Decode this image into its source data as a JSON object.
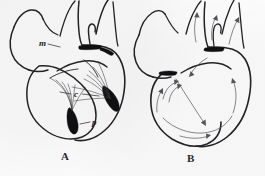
{
  "plate": {
    "kind": "anatomical-engraving",
    "subject": "heart",
    "background_color": "#fbfbfc",
    "ink_color": "#232326",
    "fill_color": "#101012",
    "arrow_color": "#55555c",
    "panels": [
      {
        "caption": "A",
        "caption_x": 61,
        "caption_y": 150,
        "description": "longitudinal section of the heart showing the valve cusps and chordae tendineae",
        "labels": [
          {
            "id": "label-m",
            "text": "m",
            "x": 39,
            "y": 39,
            "meaning": "mitral-valve-cusp",
            "leader_from": [
              49,
              44
            ],
            "leader_to": [
              72,
              50
            ]
          },
          {
            "id": "label-c",
            "text": "c",
            "x": 74,
            "y": 90,
            "meaning": "chordae-tendineae",
            "leader_from": [
              72,
              95
            ],
            "leader_to": [
              60,
              92
            ],
            "leader2_from": [
              82,
              95
            ],
            "leader2_to": [
              99,
              95
            ]
          },
          {
            "id": "label-p",
            "text": "p",
            "x": 92,
            "y": 118,
            "meaning": "papillary-muscle",
            "leader_from": [
              90,
              123
            ],
            "leader_to": [
              80,
              124
            ]
          }
        ],
        "black_regions": [
          {
            "name": "papillary-muscle-left",
            "cx": 75,
            "cy": 122
          },
          {
            "name": "papillary-muscle-right",
            "cx": 112,
            "cy": 100
          },
          {
            "name": "valve-ring-shadow",
            "cx": 92,
            "cy": 52
          }
        ],
        "chordae_count": 11
      },
      {
        "caption": "B",
        "caption_x": 187,
        "caption_y": 152,
        "description": "same heart outline with curved arrows indicating the direction of blood flow",
        "labels": [],
        "black_regions": [
          {
            "name": "valve-ring-shadow-left",
            "cx": 170,
            "cy": 76
          },
          {
            "name": "valve-ring-shadow-right",
            "cx": 214,
            "cy": 50
          }
        ],
        "arrow_count": 9
      }
    ]
  },
  "captions": {
    "panel_a": "A",
    "panel_b": "B"
  },
  "labels": {
    "m": "m",
    "c": "c",
    "p": "p"
  }
}
